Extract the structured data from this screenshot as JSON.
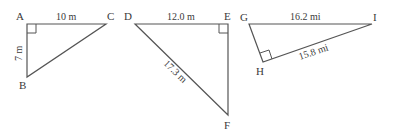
{
  "triangles": [
    {
      "id": "ABC",
      "vertices": {
        "A": "A",
        "B": "B",
        "C": "C"
      },
      "right_angle_at": "A",
      "sides": {
        "AC": "10 m",
        "AB": "7 m"
      }
    },
    {
      "id": "DEF",
      "vertices": {
        "D": "D",
        "E": "E",
        "F": "F"
      },
      "right_angle_at": "E",
      "sides": {
        "DE": "12.0 m",
        "DF": "17.3 m"
      }
    },
    {
      "id": "GHI",
      "vertices": {
        "G": "G",
        "H": "H",
        "I": "I"
      },
      "right_angle_at": "H",
      "sides": {
        "GI": "16.2 mi",
        "HI": "15.8 mi"
      }
    }
  ]
}
